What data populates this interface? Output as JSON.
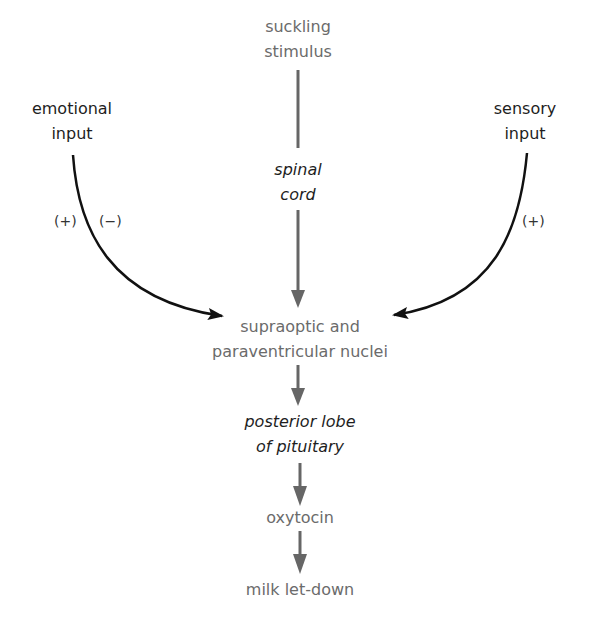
{
  "diagram": {
    "nodes": {
      "suckling_stimulus": [
        "suckling",
        "stimulus"
      ],
      "emotional_input": [
        "emotional",
        "input"
      ],
      "sensory_input": [
        "sensory",
        "input"
      ],
      "spinal_cord": [
        "spinal",
        "cord"
      ],
      "nuclei": [
        "supraoptic and",
        "paraventricular nuclei"
      ],
      "posterior_lobe": [
        "posterior lobe",
        "of pituitary"
      ],
      "oxytocin": "oxytocin",
      "milk_letdown": "milk let-down"
    },
    "edge_labels": {
      "emotional_positive": "(+)",
      "emotional_negative": "(−)",
      "sensory_positive": "(+)"
    },
    "edges": [
      {
        "from": "suckling stimulus",
        "to": "spinal cord"
      },
      {
        "from": "spinal cord",
        "to": "supraoptic and paraventricular nuclei"
      },
      {
        "from": "emotional input",
        "to": "supraoptic and paraventricular nuclei",
        "labels": [
          "(+)",
          "(−)"
        ]
      },
      {
        "from": "sensory input",
        "to": "supraoptic and paraventricular nuclei",
        "labels": [
          "(+)"
        ]
      },
      {
        "from": "supraoptic and paraventricular nuclei",
        "to": "posterior lobe of pituitary"
      },
      {
        "from": "posterior lobe of pituitary",
        "to": "oxytocin"
      },
      {
        "from": "oxytocin",
        "to": "milk let-down"
      }
    ],
    "colors": {
      "gray_arrow": "#666666",
      "black_arrow": "#111111",
      "gray_text": "#6b6b6b",
      "dark_text": "#1e1e1e"
    }
  }
}
